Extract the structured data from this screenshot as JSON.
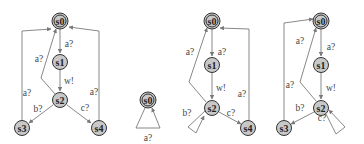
{
  "diagrams": [
    {
      "id": "automaton-1",
      "states": [
        {
          "name": "s0",
          "initial": true
        },
        {
          "name": "s1"
        },
        {
          "name": "s2"
        },
        {
          "name": "s3"
        },
        {
          "name": "s4"
        }
      ],
      "transitions": [
        {
          "from": "s0",
          "to": "s1",
          "label": "a?"
        },
        {
          "from": "s1",
          "to": "s2",
          "label": "w!"
        },
        {
          "from": "s2",
          "to": "s0",
          "label": "a?"
        },
        {
          "from": "s2",
          "to": "s3",
          "label": "b?"
        },
        {
          "from": "s2",
          "to": "s4",
          "label": "c?"
        },
        {
          "from": "s3",
          "to": "s0",
          "label": "a?"
        },
        {
          "from": "s4",
          "to": "s0",
          "label": "a?"
        }
      ]
    },
    {
      "id": "automaton-2",
      "states": [
        {
          "name": "s0",
          "initial": true
        }
      ],
      "transitions": [
        {
          "from": "s0",
          "to": "s0",
          "label": "a?"
        }
      ]
    },
    {
      "id": "automaton-3",
      "states": [
        {
          "name": "s0",
          "initial": true
        },
        {
          "name": "s1"
        },
        {
          "name": "s2"
        },
        {
          "name": "s4"
        }
      ],
      "transitions": [
        {
          "from": "s0",
          "to": "s1",
          "label": "a?"
        },
        {
          "from": "s1",
          "to": "s2",
          "label": "w!"
        },
        {
          "from": "s2",
          "to": "s0",
          "label": "a?"
        },
        {
          "from": "s2",
          "to": "s2",
          "label": "b?"
        },
        {
          "from": "s2",
          "to": "s4",
          "label": "c?"
        },
        {
          "from": "s4",
          "to": "s0",
          "label": "a?"
        }
      ]
    },
    {
      "id": "automaton-4",
      "states": [
        {
          "name": "s0",
          "initial": true
        },
        {
          "name": "s1"
        },
        {
          "name": "s2"
        },
        {
          "name": "s3"
        }
      ],
      "transitions": [
        {
          "from": "s0",
          "to": "s1",
          "label": "a?"
        },
        {
          "from": "s1",
          "to": "s2",
          "label": "w!"
        },
        {
          "from": "s2",
          "to": "s0",
          "label": "a?"
        },
        {
          "from": "s2",
          "to": "s3",
          "label": "b?"
        },
        {
          "from": "s2",
          "to": "s2",
          "label": "c?"
        },
        {
          "from": "s3",
          "to": "s0",
          "label": "a?"
        }
      ]
    }
  ],
  "labels": {
    "d1": {
      "s0": "s0",
      "s1": "s1",
      "s2": "s2",
      "s3": "s3",
      "s4": "s4",
      "e_s0s1": "a?",
      "e_s1s2": "w!",
      "e_s2s0": "a?",
      "e_s2s3": "b?",
      "e_s2s4": "c?",
      "e_s3s0": "a?",
      "e_s4s0": "a?"
    },
    "d2": {
      "s0": "s0",
      "e_loop": "a?"
    },
    "d3": {
      "s0": "s0",
      "s1": "s1",
      "s2": "s2",
      "s4": "s4",
      "e_s0s1": "a?",
      "e_s1s2": "w!",
      "e_s2s0": "a?",
      "e_loop": "b?",
      "e_s2s4": "c?",
      "e_s4s0": "a?"
    },
    "d4": {
      "s0": "s0",
      "s1": "s1",
      "s2": "s2",
      "s3": "s3",
      "e_s0s1": "a?",
      "e_s1s2": "w!",
      "e_s2s0": "a?",
      "e_s2s3": "b?",
      "e_loop": "c?",
      "e_s3s0": "a?"
    }
  },
  "colors": {
    "node_fill": "#c8c8c8",
    "node_stroke": "#333333",
    "edge": "#7a7a7a"
  }
}
